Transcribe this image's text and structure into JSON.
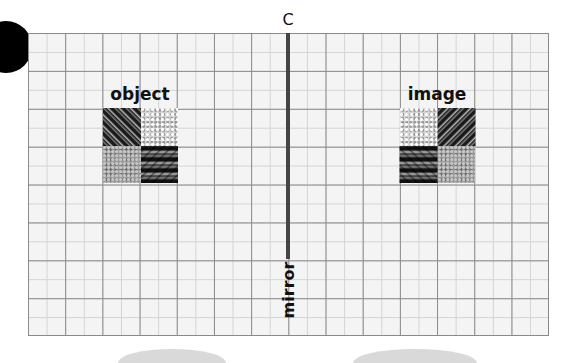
{
  "diagram": {
    "labels": {
      "axis_top": "C",
      "axis_bottom": "mirror",
      "object": "object",
      "image": "image"
    },
    "grid": {
      "columns": 14,
      "rows": 8,
      "minor_subdivisions": 2
    },
    "object_tiles": [
      "dark-streaks",
      "light-speckle",
      "mid-gray-speckle",
      "dark-wave"
    ],
    "image_tiles": [
      "light-speckle",
      "dark-streaks",
      "dark-wave",
      "mid-gray-speckle"
    ],
    "colors": {
      "mirror_line": "#444444",
      "grid_major": "#8a8a8a",
      "grid_minor": "#d4d4d4",
      "background": "#f4f4f4"
    }
  }
}
